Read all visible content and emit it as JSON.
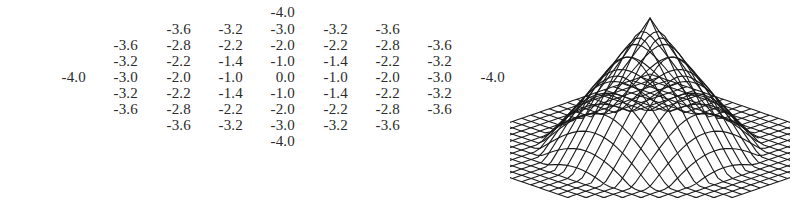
{
  "matrix": {
    "description": "9x9 sampled kernel values (diamond-shaped support)",
    "rows": [
      [
        null,
        null,
        null,
        null,
        "-4.0",
        null,
        null,
        null,
        null
      ],
      [
        null,
        null,
        "-3.6",
        "-3.2",
        "-3.0",
        "-3.2",
        "-3.6",
        null,
        null
      ],
      [
        null,
        "-3.6",
        "-2.8",
        "-2.2",
        "-2.0",
        "-2.2",
        "-2.8",
        "-3.6",
        null
      ],
      [
        null,
        "-3.2",
        "-2.2",
        "-1.4",
        "-1.0",
        "-1.4",
        "-2.2",
        "-3.2",
        null
      ],
      [
        "-4.0",
        "-3.0",
        "-2.0",
        "-1.0",
        "0.0",
        "-1.0",
        "-2.0",
        "-3.0",
        "-4.0"
      ],
      [
        null,
        "-3.2",
        "-2.2",
        "-1.4",
        "-1.0",
        "-1.4",
        "-2.2",
        "-3.2",
        null
      ],
      [
        null,
        "-3.6",
        "-2.8",
        "-2.2",
        "-2.0",
        "-2.2",
        "-2.8",
        "-3.6",
        null
      ],
      [
        null,
        null,
        "-3.6",
        "-3.2",
        "-3.0",
        "-3.2",
        "-3.6",
        null,
        null
      ],
      [
        null,
        null,
        null,
        null,
        "-4.0",
        null,
        null,
        null,
        null
      ]
    ]
  },
  "surface_plot": {
    "type": "3d-mesh",
    "shape": "peaked surface on flat square base",
    "grid_lines": 24,
    "line_color": "#1a1a1a"
  }
}
